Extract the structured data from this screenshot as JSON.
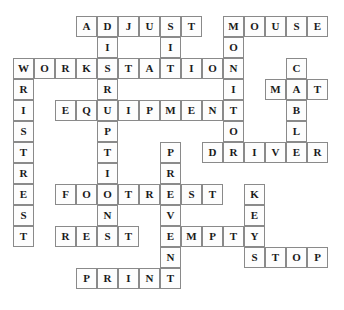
{
  "puzzle": {
    "type": "crossword-answer-grid",
    "grid": {
      "origin_x": 13,
      "origin_y": 16,
      "cell_size": 21,
      "columns": 15,
      "rows": 13
    },
    "entries": [
      {
        "word": "ADJUST",
        "direction": "across",
        "row": 0,
        "col": 3
      },
      {
        "word": "MOUSE",
        "direction": "across",
        "row": 0,
        "col": 10
      },
      {
        "word": "WORKSTATION",
        "direction": "across",
        "row": 2,
        "col": 0
      },
      {
        "word": "MAT",
        "direction": "across",
        "row": 3,
        "col": 12
      },
      {
        "word": "EQUIPMENT",
        "direction": "across",
        "row": 4,
        "col": 2
      },
      {
        "word": "DRIVER",
        "direction": "across",
        "row": 6,
        "col": 9
      },
      {
        "word": "FOOTREST",
        "direction": "across",
        "row": 8,
        "col": 2
      },
      {
        "word": "REST",
        "direction": "across",
        "row": 10,
        "col": 2
      },
      {
        "word": "EMPTY",
        "direction": "across",
        "row": 10,
        "col": 7
      },
      {
        "word": "STOP",
        "direction": "across",
        "row": 11,
        "col": 11
      },
      {
        "word": "PRINT",
        "direction": "across",
        "row": 12,
        "col": 3
      },
      {
        "word": "DISRUPTIONS",
        "direction": "down",
        "row": 0,
        "col": 4
      },
      {
        "word": "SIT",
        "direction": "down",
        "row": 0,
        "col": 7
      },
      {
        "word": "MONITOR",
        "direction": "down",
        "row": 0,
        "col": 10
      },
      {
        "word": "WRISTREST",
        "direction": "down",
        "row": 2,
        "col": 0
      },
      {
        "word": "CABLE",
        "direction": "down",
        "row": 2,
        "col": 13
      },
      {
        "word": "PRVEN",
        "direction": "down",
        "row": 6,
        "col": 7
      },
      {
        "word": "KEY",
        "direction": "down",
        "row": 8,
        "col": 11
      }
    ],
    "cells": [
      {
        "row": 0,
        "col": 3,
        "letter": "A"
      },
      {
        "row": 0,
        "col": 4,
        "letter": "D"
      },
      {
        "row": 0,
        "col": 5,
        "letter": "J"
      },
      {
        "row": 0,
        "col": 6,
        "letter": "U"
      },
      {
        "row": 0,
        "col": 7,
        "letter": "S"
      },
      {
        "row": 0,
        "col": 8,
        "letter": "T"
      },
      {
        "row": 0,
        "col": 10,
        "letter": "M"
      },
      {
        "row": 0,
        "col": 11,
        "letter": "O"
      },
      {
        "row": 0,
        "col": 12,
        "letter": "U"
      },
      {
        "row": 0,
        "col": 13,
        "letter": "S"
      },
      {
        "row": 0,
        "col": 14,
        "letter": "E"
      },
      {
        "row": 1,
        "col": 4,
        "letter": "I"
      },
      {
        "row": 1,
        "col": 7,
        "letter": "I"
      },
      {
        "row": 1,
        "col": 10,
        "letter": "O"
      },
      {
        "row": 2,
        "col": 0,
        "letter": "W"
      },
      {
        "row": 2,
        "col": 1,
        "letter": "O"
      },
      {
        "row": 2,
        "col": 2,
        "letter": "R"
      },
      {
        "row": 2,
        "col": 3,
        "letter": "K"
      },
      {
        "row": 2,
        "col": 4,
        "letter": "S"
      },
      {
        "row": 2,
        "col": 5,
        "letter": "T"
      },
      {
        "row": 2,
        "col": 6,
        "letter": "A"
      },
      {
        "row": 2,
        "col": 7,
        "letter": "T"
      },
      {
        "row": 2,
        "col": 8,
        "letter": "I"
      },
      {
        "row": 2,
        "col": 9,
        "letter": "O"
      },
      {
        "row": 2,
        "col": 10,
        "letter": "N"
      },
      {
        "row": 2,
        "col": 13,
        "letter": "C"
      },
      {
        "row": 3,
        "col": 0,
        "letter": "R"
      },
      {
        "row": 3,
        "col": 4,
        "letter": "R"
      },
      {
        "row": 3,
        "col": 10,
        "letter": "I"
      },
      {
        "row": 3,
        "col": 12,
        "letter": "M"
      },
      {
        "row": 3,
        "col": 13,
        "letter": "A"
      },
      {
        "row": 3,
        "col": 14,
        "letter": "T"
      },
      {
        "row": 4,
        "col": 0,
        "letter": "I"
      },
      {
        "row": 4,
        "col": 2,
        "letter": "E"
      },
      {
        "row": 4,
        "col": 3,
        "letter": "Q"
      },
      {
        "row": 4,
        "col": 4,
        "letter": "U"
      },
      {
        "row": 4,
        "col": 5,
        "letter": "I"
      },
      {
        "row": 4,
        "col": 6,
        "letter": "P"
      },
      {
        "row": 4,
        "col": 7,
        "letter": "M"
      },
      {
        "row": 4,
        "col": 8,
        "letter": "E"
      },
      {
        "row": 4,
        "col": 9,
        "letter": "N"
      },
      {
        "row": 4,
        "col": 10,
        "letter": "T"
      },
      {
        "row": 4,
        "col": 13,
        "letter": "B"
      },
      {
        "row": 5,
        "col": 0,
        "letter": "S"
      },
      {
        "row": 5,
        "col": 4,
        "letter": "P"
      },
      {
        "row": 5,
        "col": 10,
        "letter": "O"
      },
      {
        "row": 5,
        "col": 13,
        "letter": "L"
      },
      {
        "row": 6,
        "col": 0,
        "letter": "T"
      },
      {
        "row": 6,
        "col": 4,
        "letter": "T"
      },
      {
        "row": 6,
        "col": 7,
        "letter": "P"
      },
      {
        "row": 6,
        "col": 9,
        "letter": "D"
      },
      {
        "row": 6,
        "col": 10,
        "letter": "R"
      },
      {
        "row": 6,
        "col": 11,
        "letter": "I"
      },
      {
        "row": 6,
        "col": 12,
        "letter": "V"
      },
      {
        "row": 6,
        "col": 13,
        "letter": "E"
      },
      {
        "row": 6,
        "col": 14,
        "letter": "R"
      },
      {
        "row": 7,
        "col": 0,
        "letter": "R"
      },
      {
        "row": 7,
        "col": 4,
        "letter": "I"
      },
      {
        "row": 7,
        "col": 7,
        "letter": "R"
      },
      {
        "row": 8,
        "col": 0,
        "letter": "E"
      },
      {
        "row": 8,
        "col": 2,
        "letter": "F"
      },
      {
        "row": 8,
        "col": 3,
        "letter": "O"
      },
      {
        "row": 8,
        "col": 4,
        "letter": "O"
      },
      {
        "row": 8,
        "col": 5,
        "letter": "T"
      },
      {
        "row": 8,
        "col": 6,
        "letter": "R"
      },
      {
        "row": 8,
        "col": 7,
        "letter": "E"
      },
      {
        "row": 8,
        "col": 8,
        "letter": "S"
      },
      {
        "row": 8,
        "col": 9,
        "letter": "T"
      },
      {
        "row": 8,
        "col": 11,
        "letter": "K"
      },
      {
        "row": 9,
        "col": 0,
        "letter": "S"
      },
      {
        "row": 9,
        "col": 4,
        "letter": "N"
      },
      {
        "row": 9,
        "col": 7,
        "letter": "V"
      },
      {
        "row": 9,
        "col": 11,
        "letter": "E"
      },
      {
        "row": 10,
        "col": 0,
        "letter": "T"
      },
      {
        "row": 10,
        "col": 2,
        "letter": "R"
      },
      {
        "row": 10,
        "col": 3,
        "letter": "E"
      },
      {
        "row": 10,
        "col": 4,
        "letter": "S"
      },
      {
        "row": 10,
        "col": 5,
        "letter": "T"
      },
      {
        "row": 10,
        "col": 7,
        "letter": "E"
      },
      {
        "row": 10,
        "col": 8,
        "letter": "M"
      },
      {
        "row": 10,
        "col": 9,
        "letter": "P"
      },
      {
        "row": 10,
        "col": 10,
        "letter": "T"
      },
      {
        "row": 10,
        "col": 11,
        "letter": "Y"
      },
      {
        "row": 11,
        "col": 7,
        "letter": "N"
      },
      {
        "row": 11,
        "col": 11,
        "letter": "S"
      },
      {
        "row": 11,
        "col": 12,
        "letter": "T"
      },
      {
        "row": 11,
        "col": 13,
        "letter": "O"
      },
      {
        "row": 11,
        "col": 14,
        "letter": "P"
      },
      {
        "row": 12,
        "col": 3,
        "letter": "P"
      },
      {
        "row": 12,
        "col": 4,
        "letter": "R"
      },
      {
        "row": 12,
        "col": 5,
        "letter": "I"
      },
      {
        "row": 12,
        "col": 6,
        "letter": "N"
      },
      {
        "row": 12,
        "col": 7,
        "letter": "T"
      }
    ]
  },
  "colors": {
    "cell_border": "#8a8a8a",
    "cell_fill": "#fdfdfd",
    "letter": "#1a1a1a",
    "background": "#ffffff"
  }
}
